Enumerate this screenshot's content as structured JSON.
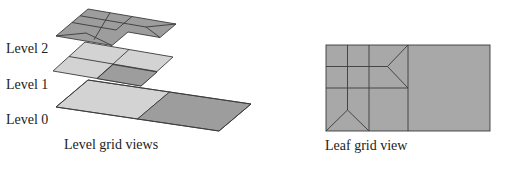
{
  "levels": [
    {
      "id": "level-2",
      "label": "Level 2"
    },
    {
      "id": "level-1",
      "label": "Level 1"
    },
    {
      "id": "level-0",
      "label": "Level 0"
    }
  ],
  "captions": {
    "left": "Level grid views",
    "right": "Leaf grid view"
  },
  "colors": {
    "light_cell": "#d3d3d3",
    "dark_cell": "#9d9d9d",
    "edge": "#3a3a3a"
  }
}
